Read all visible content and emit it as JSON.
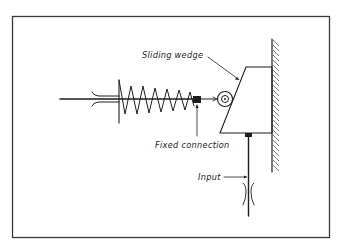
{
  "diagram": {
    "type": "mechanical-schematic",
    "labels": {
      "sliding_wedge": "Sliding wedge",
      "fixed_connection": "Fixed connection",
      "input": "Input"
    },
    "components": [
      {
        "name": "Rod with guide",
        "description": "Horizontal rod passing through a guide bushing on the left"
      },
      {
        "name": "Compression spring",
        "description": "Spring on the horizontal rod between the guide and the fixed connection"
      },
      {
        "name": "Fixed connection",
        "description": "Block fixing the spring end to the rod"
      },
      {
        "name": "Roller",
        "description": "Roller at end of rod riding on the sliding wedge's inclined face"
      },
      {
        "name": "Sliding wedge",
        "description": "Trapezoidal wedge sliding vertically along a fixed wall"
      },
      {
        "name": "Fixed wall",
        "description": "Hatched vertical ground surface on the right"
      },
      {
        "name": "Input rod",
        "description": "Vertical input rod attached to the bottom of the wedge, passing through a guide"
      }
    ],
    "colors": {
      "ink": "#1e1e1e",
      "background": "#ffffff",
      "frame": "#3a3a3a"
    }
  }
}
